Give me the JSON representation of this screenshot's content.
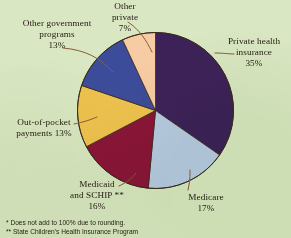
{
  "chart_data": {
    "type": "pie",
    "title": "",
    "subtitle": "",
    "xlabel": "",
    "ylabel": "",
    "legend_position": "callout-labels",
    "grid": false,
    "background_color": "#d9e7c2",
    "start_angle_deg": 0,
    "direction": "clockwise",
    "categories": [
      "Private health insurance",
      "Medicare",
      "Medicaid and SCHIP **",
      "Out-of-pocket payments",
      "Other government programs",
      "Other private"
    ],
    "values": [
      35,
      17,
      16,
      13,
      13,
      7
    ],
    "unit": "%",
    "colors": [
      "#3d2259",
      "#b8cbe5",
      "#8b1538",
      "#efc24e",
      "#3d4c9a",
      "#f7cba4"
    ],
    "slices": [
      {
        "label": "Private health insurance",
        "value": 35,
        "value_text": "35%",
        "color": "#3d2259"
      },
      {
        "label": "Medicare",
        "value": 17,
        "value_text": "17%",
        "color": "#b8cbe5"
      },
      {
        "label": "Medicaid and SCHIP **",
        "value": 16,
        "value_text": "16%",
        "color": "#8b1538"
      },
      {
        "label": "Out-of-pocket payments",
        "value": 13,
        "value_text": "13%",
        "color": "#efc24e"
      },
      {
        "label": "Other government programs",
        "value": 13,
        "value_text": "13%",
        "color": "#3d4c9a"
      },
      {
        "label": "Other private",
        "value": 7,
        "value_text": "7%",
        "color": "#f7cba4"
      }
    ]
  },
  "labels": {
    "other_private": "Other\nprivate\n7%",
    "other_government_programs": "Other government\nprograms\n13%",
    "private_health_insurance": "Private health\ninsurance\n35%",
    "out_of_pocket_payments": "Out-of-pocket\npayments 13%",
    "medicaid_schip": "Medicaid\nand SCHIP **\n16%",
    "medicare": "Medicare\n17%"
  },
  "footnotes": {
    "line1": "*  Does not add to 100% due to rounding.",
    "line2": "** State Children's Health Insurance Program"
  },
  "colors": {
    "background": "#d9e7c2",
    "text": "#241a12",
    "leader_line": "#8a5a3a",
    "pie_outline": "#3a2a1c"
  }
}
